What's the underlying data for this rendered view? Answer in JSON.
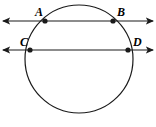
{
  "figure": {
    "background_color": "#ffffff",
    "stroke_color": "#1a1a1a",
    "canvas": {
      "width": 156,
      "height": 127
    }
  },
  "circle": {
    "name": "circle",
    "center_x": 79,
    "center_y": 59,
    "radius": 54,
    "stroke_width": 1.2
  },
  "lines": [
    {
      "id": "line-ab",
      "label": "AB",
      "y": 21,
      "x_start": 3,
      "x_end": 153,
      "arrow_both_ends": true
    },
    {
      "id": "line-cd",
      "label": "CD",
      "y": 50,
      "x_start": 3,
      "x_end": 153,
      "arrow_both_ends": true
    }
  ],
  "points": [
    {
      "id": "point-a",
      "label": "A",
      "x": 45,
      "y": 21,
      "label_x": 35,
      "label_y": 6
    },
    {
      "id": "point-b",
      "label": "B",
      "x": 113,
      "y": 21,
      "label_x": 117,
      "label_y": 6
    },
    {
      "id": "point-c",
      "label": "C",
      "x": 30,
      "y": 50,
      "label_x": 20,
      "label_y": 36
    },
    {
      "id": "point-d",
      "label": "D",
      "x": 128,
      "y": 50,
      "label_x": 133,
      "label_y": 36
    }
  ]
}
